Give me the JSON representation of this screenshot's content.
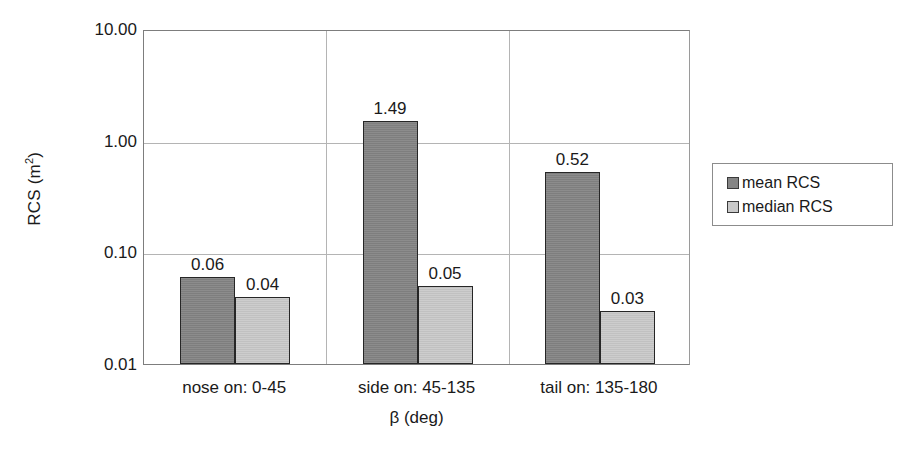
{
  "chart_data": {
    "type": "bar",
    "title": "",
    "xlabel": "β (deg)",
    "ylabel": "RCS (m²)",
    "ylabel_base": "RCS (m",
    "ylabel_sup": "2",
    "ylabel_close": ")",
    "yscale": "log",
    "ylim": [
      0.01,
      10.0
    ],
    "ytick_labels": [
      "10.00",
      "1.00",
      "0.10",
      "0.01"
    ],
    "ytick_values": [
      10.0,
      1.0,
      0.1,
      0.01
    ],
    "grid": "horizontal-and-category-separators",
    "legend_position": "right",
    "categories": [
      "nose on:  0-45",
      "side on: 45-135",
      "tail on: 135-180"
    ],
    "series": [
      {
        "name": "mean RCS",
        "color": "#858585",
        "values": [
          0.06,
          1.49,
          0.52
        ],
        "labels": [
          "0.06",
          "1.49",
          "0.52"
        ]
      },
      {
        "name": "median RCS",
        "color": "#c9c9c9",
        "values": [
          0.04,
          0.05,
          0.03
        ],
        "labels": [
          "0.04",
          "0.05",
          "0.03"
        ]
      }
    ]
  },
  "legend": {
    "items": [
      {
        "label": "mean RCS",
        "swatch": "mean"
      },
      {
        "label": "median RCS",
        "swatch": "median"
      }
    ]
  }
}
